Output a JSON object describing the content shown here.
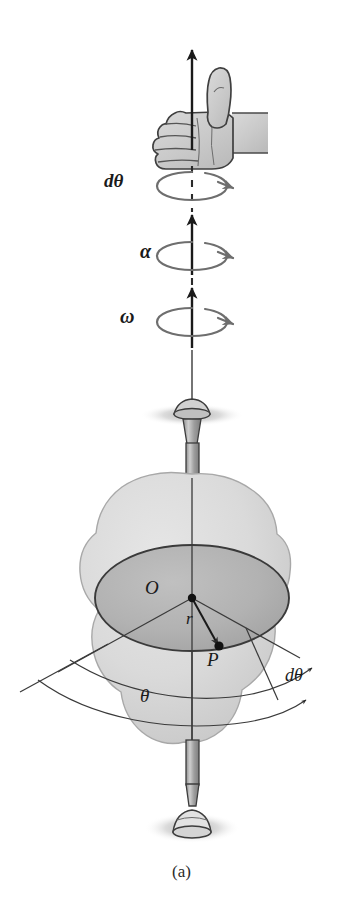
{
  "figure": {
    "caption": "(a)",
    "background_color": "#ffffff"
  },
  "labels": {
    "angular_displacement_top": "dθ",
    "angular_acceleration": "α",
    "angular_velocity": "ω",
    "center": "O",
    "radius": "r",
    "point": "P",
    "angle": "θ",
    "angular_displacement_bottom": "dθ"
  },
  "colors": {
    "body_fill": "#d8d8d8",
    "body_edge": "#9a9a9a",
    "disk_fill": "#b4b4b4",
    "disk_edge": "#3a3a3a",
    "axis_line": "#2a2a2a",
    "arrow_dark": "#1a1a1a",
    "rotation_arrow": "#6e6e6e",
    "hand_fill": "#cfcfcf",
    "hand_edge": "#4a4a4a",
    "shaft_fill": "#a8a8a8",
    "shaft_edge": "#3c3c3c",
    "shadow": "#b8b8b8",
    "label_text": "#1a1a1a"
  },
  "elements": {
    "hand_icon": "thumbs-up-hand",
    "top_bearing": "pivot-bearing-top",
    "bottom_bearing": "pivot-bearing-bottom",
    "rotation_arrows": [
      "dtheta-rotation-arrow",
      "alpha-rotation-arrow",
      "omega-rotation-arrow"
    ],
    "vector_arrows": [
      "dtheta-vector-arrow",
      "alpha-vector-arrow",
      "omega-vector-arrow"
    ],
    "disk": "rotating-disk-ellipse",
    "body": "rigid-body-blob",
    "axis": "rotation-axis-line"
  },
  "geometry": {
    "axis_x": 192,
    "disk_center": [
      192,
      598
    ],
    "disk_rx": 97,
    "disk_ry": 53,
    "point_P": [
      218,
      645
    ],
    "arrow_tip_top": [
      192,
      48
    ]
  }
}
